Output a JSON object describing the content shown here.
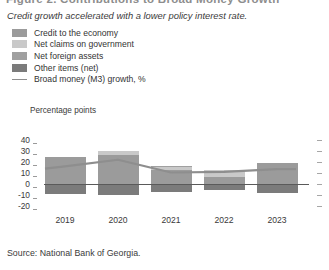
{
  "figure": {
    "title_cropped": "Figure 2.  Contributions to Broad Money Growth",
    "subtitle": "Credit growth accelerated with a lower policy interest rate.",
    "source": "Source: National Bank of Georgia."
  },
  "legend": {
    "items": [
      {
        "label": "Credit to the economy",
        "color": "#9b9b9b",
        "marker": "swatch-icon"
      },
      {
        "label": "Net claims on government",
        "color": "#c9c9c9",
        "marker": "swatch-icon"
      },
      {
        "label": "Net foreign assets",
        "color": "#a0a0a0",
        "marker": "swatch-icon"
      },
      {
        "label": "Other items (net)",
        "color": "#7b7b7b",
        "marker": "swatch-icon"
      },
      {
        "label": "Broad money (M3) growth, %",
        "color": "#8e8e8e",
        "marker": "line-icon"
      }
    ]
  },
  "axis": {
    "unit_label": "Percentage points",
    "yticks": [
      "40",
      "30",
      "20",
      "10",
      "0",
      "-10",
      "-20"
    ],
    "ytick_values": [
      40,
      30,
      20,
      10,
      0,
      -10,
      -20
    ]
  },
  "chart_data": {
    "type": "bar",
    "title": "Figure 2.  Contributions to Broad Money Growth",
    "subtitle": "Credit growth accelerated with a lower policy interest rate.",
    "xlabel": "",
    "ylabel": "Percentage points",
    "ylim": [
      -20,
      40
    ],
    "grid": false,
    "legend_position": "top-left",
    "stacked": true,
    "categories": [
      "2019",
      "2020",
      "2021",
      "2022",
      "2023"
    ],
    "series": [
      {
        "name": "Credit to the economy",
        "color": "#9b9b9b",
        "values": [
          25.0,
          26.5,
          13.0,
          6.5,
          19.5
        ]
      },
      {
        "name": "Net claims on government",
        "color": "#c9c9c9",
        "values": [
          0.0,
          3.5,
          2.5,
          6.5,
          0.0
        ]
      },
      {
        "name": "Net foreign assets",
        "color": "#a0a0a0",
        "values": [
          0.0,
          0.0,
          0.5,
          0.0,
          0.0
        ]
      },
      {
        "name": "Other items (net)",
        "color": "#7b7b7b",
        "values": [
          -9.0,
          -10.0,
          -7.0,
          -5.5,
          -8.0
        ]
      }
    ],
    "line_series": {
      "name": "Broad money (M3) growth, %",
      "color": "#8e8e8e",
      "values": [
        16.0,
        22.0,
        10.5,
        11.0,
        13.5
      ]
    },
    "source": "Source: National Bank of Georgia."
  }
}
